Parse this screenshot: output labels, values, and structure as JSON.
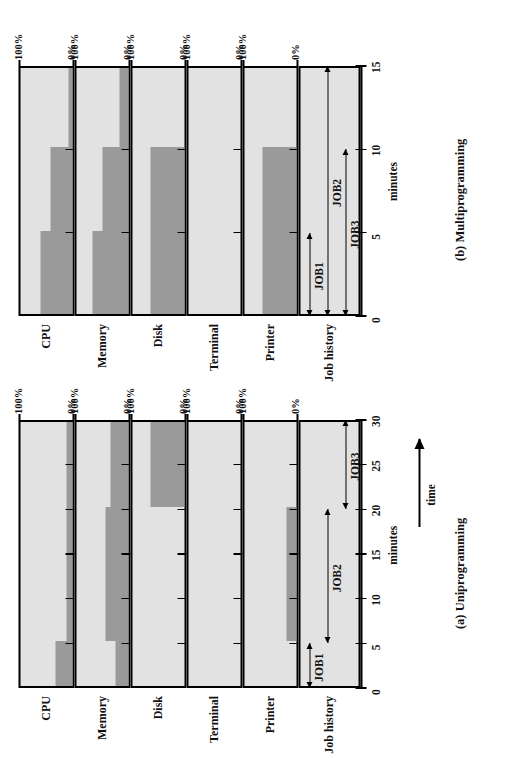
{
  "figure": {
    "background": "#ffffff",
    "fill_color": "#9a9a9a",
    "track_bg": "#e2e2e2",
    "line_color": "#000000"
  },
  "panels": [
    {
      "id": "uniprogramming",
      "caption": "(a) Uniprogramming",
      "axis": {
        "label": "minutes",
        "time_label": "time",
        "ticks": [
          "0",
          "5",
          "10",
          "15",
          "20",
          "25",
          "30"
        ],
        "min": 0,
        "max": 30
      },
      "scale_labels": {
        "top": "100%",
        "bottom": "0%"
      },
      "tracks": [
        {
          "name": "CPU"
        },
        {
          "name": "Memory"
        },
        {
          "name": "Disk"
        },
        {
          "name": "Terminal"
        },
        {
          "name": "Printer"
        }
      ],
      "job_history": {
        "label": "Job history",
        "jobs": [
          {
            "label": "JOB1",
            "start": 0,
            "end": 5
          },
          {
            "label": "JOB2",
            "start": 5,
            "end": 20
          },
          {
            "label": "JOB3",
            "start": 20,
            "end": 30
          }
        ]
      }
    },
    {
      "id": "multiprogramming",
      "caption": "(b) Multiprogramming",
      "axis": {
        "label": "minutes",
        "time_label": "",
        "ticks": [
          "0",
          "5",
          "10",
          "15"
        ],
        "min": 0,
        "max": 15
      },
      "scale_labels": {
        "top": "100%",
        "bottom": "0%"
      },
      "tracks": [
        {
          "name": "CPU"
        },
        {
          "name": "Memory"
        },
        {
          "name": "Disk"
        },
        {
          "name": "Terminal"
        },
        {
          "name": "Printer"
        }
      ],
      "job_history": {
        "label": "Job history",
        "jobs": [
          {
            "label": "JOB1",
            "start": 0,
            "end": 5
          },
          {
            "label": "JOB2",
            "start": 0,
            "end": 15
          },
          {
            "label": "JOB3",
            "start": 0,
            "end": 10
          }
        ]
      }
    }
  ],
  "chart_data": {
    "type": "area",
    "xlabel": "minutes",
    "ylabel": "utilization (%)",
    "ylim": [
      0,
      100
    ],
    "grid": false,
    "legend": "none",
    "charts": [
      {
        "panel": "(a) Uniprogramming",
        "x": [
          0,
          5,
          10,
          15,
          20,
          25,
          30
        ],
        "xlim": [
          0,
          30
        ],
        "xticks": [
          0,
          5,
          10,
          15,
          20,
          25,
          30
        ],
        "series": [
          {
            "name": "CPU",
            "steps": [
              {
                "from": 0,
                "to": 5,
                "value": 33
              },
              {
                "from": 5,
                "to": 30,
                "value": 12
              }
            ]
          },
          {
            "name": "Memory",
            "steps": [
              {
                "from": 0,
                "to": 5,
                "value": 25
              },
              {
                "from": 5,
                "to": 20,
                "value": 44
              },
              {
                "from": 20,
                "to": 30,
                "value": 34
              }
            ]
          },
          {
            "name": "Disk",
            "steps": [
              {
                "from": 0,
                "to": 20,
                "value": 0
              },
              {
                "from": 20,
                "to": 30,
                "value": 65
              }
            ]
          },
          {
            "name": "Terminal",
            "steps": [
              {
                "from": 0,
                "to": 30,
                "value": 0
              }
            ]
          },
          {
            "name": "Printer",
            "steps": [
              {
                "from": 0,
                "to": 5,
                "value": 0
              },
              {
                "from": 5,
                "to": 20,
                "value": 20
              },
              {
                "from": 20,
                "to": 30,
                "value": 0
              }
            ]
          }
        ]
      },
      {
        "panel": "(b) Multiprogramming",
        "x": [
          0,
          5,
          10,
          15
        ],
        "xlim": [
          0,
          15
        ],
        "xticks": [
          0,
          5,
          10,
          15
        ],
        "series": [
          {
            "name": "CPU",
            "steps": [
              {
                "from": 0,
                "to": 5,
                "value": 62
              },
              {
                "from": 5,
                "to": 10,
                "value": 42
              },
              {
                "from": 10,
                "to": 15,
                "value": 8
              }
            ]
          },
          {
            "name": "Memory",
            "steps": [
              {
                "from": 0,
                "to": 5,
                "value": 70
              },
              {
                "from": 5,
                "to": 10,
                "value": 50
              },
              {
                "from": 10,
                "to": 15,
                "value": 18
              }
            ]
          },
          {
            "name": "Disk",
            "steps": [
              {
                "from": 0,
                "to": 10,
                "value": 65
              },
              {
                "from": 10,
                "to": 15,
                "value": 0
              }
            ]
          },
          {
            "name": "Terminal",
            "steps": [
              {
                "from": 0,
                "to": 15,
                "value": 0
              }
            ]
          },
          {
            "name": "Printer",
            "steps": [
              {
                "from": 0,
                "to": 10,
                "value": 66
              },
              {
                "from": 10,
                "to": 15,
                "value": 0
              }
            ]
          }
        ]
      }
    ]
  }
}
